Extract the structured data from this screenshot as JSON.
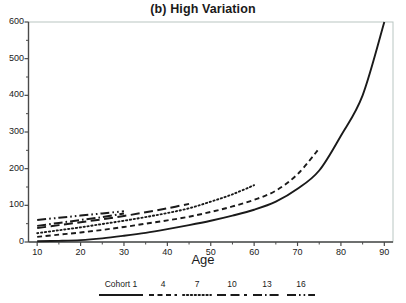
{
  "chart_data": {
    "type": "line",
    "title": "(b) High Variation",
    "xlabel": "Age",
    "ylabel": "",
    "xlim": [
      8,
      92
    ],
    "ylim": [
      0,
      600
    ],
    "xticks": [
      10,
      20,
      30,
      40,
      50,
      60,
      70,
      80,
      90
    ],
    "yticks": [
      0,
      100,
      200,
      300,
      400,
      500,
      600
    ],
    "minor_ticks": true,
    "grid": false,
    "legend_position": "bottom",
    "legend_title": "Cohort 1",
    "series": [
      {
        "name": "Cohort 1",
        "legend_label": "Cohort 1",
        "style": "solid",
        "x": [
          10,
          15,
          20,
          25,
          30,
          35,
          40,
          45,
          50,
          55,
          60,
          65,
          70,
          75,
          80,
          85,
          90
        ],
        "y": [
          2,
          3,
          5,
          10,
          17,
          25,
          35,
          46,
          58,
          72,
          88,
          110,
          145,
          195,
          290,
          400,
          600
        ]
      },
      {
        "name": "Cohort 4",
        "legend_label": "4",
        "style": "dashed",
        "x": [
          10,
          15,
          20,
          25,
          30,
          35,
          40,
          45,
          50,
          55,
          60,
          65,
          70,
          75
        ],
        "y": [
          14,
          20,
          26,
          33,
          41,
          50,
          59,
          69,
          82,
          97,
          115,
          140,
          185,
          255
        ]
      },
      {
        "name": "Cohort 7",
        "legend_label": "7",
        "style": "dotted",
        "x": [
          10,
          15,
          20,
          25,
          30,
          35,
          40,
          45,
          50,
          55,
          60
        ],
        "y": [
          24,
          32,
          40,
          49,
          58,
          68,
          79,
          92,
          110,
          130,
          155
        ]
      },
      {
        "name": "Cohort 10",
        "legend_label": "10",
        "style": "long-dash",
        "x": [
          10,
          15,
          20,
          25,
          30,
          35,
          40,
          45
        ],
        "y": [
          38,
          46,
          54,
          62,
          71,
          81,
          92,
          104
        ]
      },
      {
        "name": "Cohort 13",
        "legend_label": "13",
        "style": "dash-dot",
        "x": [
          10,
          15,
          20,
          25,
          30
        ],
        "y": [
          44,
          52,
          60,
          68,
          78
        ]
      },
      {
        "name": "Cohort 16",
        "legend_label": "16",
        "style": "dash-dot-dot",
        "x": [
          10,
          15,
          20,
          25,
          30
        ],
        "y": [
          60,
          66,
          72,
          78,
          84
        ]
      }
    ]
  },
  "colors": {
    "line": "#1a1a1a",
    "axis": "#4a4a4a",
    "background": "#ffffff"
  }
}
